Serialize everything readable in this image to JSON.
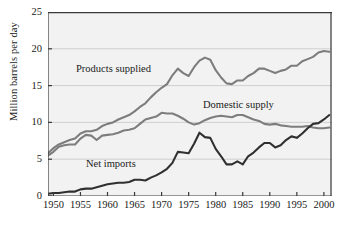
{
  "chart_data": {
    "type": "line",
    "title": "",
    "xlabel": "",
    "ylabel": "Million barrels per day",
    "xlim": [
      1949,
      2001.5
    ],
    "ylim": [
      0,
      25
    ],
    "grid": true,
    "legend_position": "inline-annotations",
    "xticks": [
      "1950",
      "1955",
      "1960",
      "1965",
      "1970",
      "1975",
      "1980",
      "1985",
      "1990",
      "1995",
      "2000"
    ],
    "xtick_values": [
      1950,
      1955,
      1960,
      1965,
      1970,
      1975,
      1980,
      1985,
      1990,
      1995,
      2000
    ],
    "yticks": [
      "0",
      "5",
      "10",
      "15",
      "20",
      "25"
    ],
    "ytick_values": [
      0,
      5,
      10,
      15,
      20,
      25
    ],
    "annotations": [
      {
        "text": "Products supplied",
        "x": 76,
        "y": 63
      },
      {
        "text": "Domestic supply",
        "x": 203,
        "y": 99
      },
      {
        "text": "Net imports",
        "x": 86,
        "y": 158
      }
    ],
    "series": [
      {
        "name": "Products supplied",
        "color": "#7d7d7d",
        "x": [
          1949,
          1950,
          1951,
          1952,
          1953,
          1954,
          1955,
          1956,
          1957,
          1958,
          1959,
          1960,
          1961,
          1962,
          1963,
          1964,
          1965,
          1966,
          1967,
          1968,
          1969,
          1970,
          1971,
          1972,
          1973,
          1974,
          1975,
          1976,
          1977,
          1978,
          1979,
          1980,
          1981,
          1982,
          1983,
          1984,
          1985,
          1986,
          1987,
          1988,
          1989,
          1990,
          1991,
          1992,
          1993,
          1994,
          1995,
          1996,
          1997,
          1998,
          1999,
          2000,
          2001
        ],
        "values": [
          5.8,
          6.5,
          7.0,
          7.3,
          7.6,
          7.8,
          8.5,
          8.8,
          8.8,
          9.0,
          9.5,
          9.8,
          10.0,
          10.4,
          10.7,
          11.0,
          11.5,
          12.1,
          12.6,
          13.4,
          14.1,
          14.7,
          15.2,
          16.4,
          17.3,
          16.7,
          16.3,
          17.5,
          18.4,
          18.8,
          18.5,
          17.1,
          16.1,
          15.3,
          15.2,
          15.7,
          15.7,
          16.3,
          16.7,
          17.3,
          17.3,
          17.0,
          16.7,
          17.0,
          17.2,
          17.7,
          17.7,
          18.3,
          18.6,
          18.9,
          19.5,
          19.7,
          19.6
        ]
      },
      {
        "name": "Domestic supply",
        "color": "#7d7d7d",
        "x": [
          1949,
          1950,
          1951,
          1952,
          1953,
          1954,
          1955,
          1956,
          1957,
          1958,
          1959,
          1960,
          1961,
          1962,
          1963,
          1964,
          1965,
          1966,
          1967,
          1968,
          1969,
          1970,
          1971,
          1972,
          1973,
          1974,
          1975,
          1976,
          1977,
          1978,
          1979,
          1980,
          1981,
          1982,
          1983,
          1984,
          1985,
          1986,
          1987,
          1988,
          1989,
          1990,
          1991,
          1992,
          1993,
          1994,
          1995,
          1996,
          1997,
          1998,
          1999,
          2000,
          2001
        ],
        "values": [
          5.5,
          6.0,
          6.7,
          6.9,
          7.0,
          7.0,
          7.8,
          8.3,
          8.2,
          7.6,
          8.2,
          8.3,
          8.4,
          8.6,
          8.9,
          9.0,
          9.2,
          9.8,
          10.4,
          10.6,
          10.8,
          11.3,
          11.2,
          11.2,
          10.9,
          10.5,
          10.0,
          9.7,
          9.9,
          10.3,
          10.6,
          10.8,
          10.9,
          10.8,
          10.7,
          11.0,
          11.0,
          10.7,
          10.4,
          10.2,
          9.8,
          9.7,
          9.8,
          9.6,
          9.5,
          9.4,
          9.4,
          9.4,
          9.5,
          9.3,
          9.2,
          9.2,
          9.3
        ]
      },
      {
        "name": "Net imports",
        "color": "#303030",
        "x": [
          1949,
          1950,
          1951,
          1952,
          1953,
          1954,
          1955,
          1956,
          1957,
          1958,
          1959,
          1960,
          1961,
          1962,
          1963,
          1964,
          1965,
          1966,
          1967,
          1968,
          1969,
          1970,
          1971,
          1972,
          1973,
          1974,
          1975,
          1976,
          1977,
          1978,
          1979,
          1980,
          1981,
          1982,
          1983,
          1984,
          1985,
          1986,
          1987,
          1988,
          1989,
          1990,
          1991,
          1992,
          1993,
          1994,
          1995,
          1996,
          1997,
          1998,
          1999,
          2000,
          2001
        ],
        "values": [
          0.3,
          0.4,
          0.4,
          0.5,
          0.6,
          0.6,
          0.9,
          1.0,
          1.0,
          1.2,
          1.4,
          1.6,
          1.7,
          1.8,
          1.8,
          1.9,
          2.2,
          2.2,
          2.1,
          2.5,
          2.8,
          3.2,
          3.7,
          4.5,
          6.0,
          5.9,
          5.8,
          7.1,
          8.6,
          8.0,
          7.9,
          6.4,
          5.4,
          4.3,
          4.3,
          4.7,
          4.3,
          5.4,
          5.9,
          6.6,
          7.2,
          7.2,
          6.6,
          6.9,
          7.6,
          8.1,
          7.9,
          8.5,
          9.2,
          9.8,
          9.9,
          10.4,
          11.0
        ]
      }
    ]
  }
}
